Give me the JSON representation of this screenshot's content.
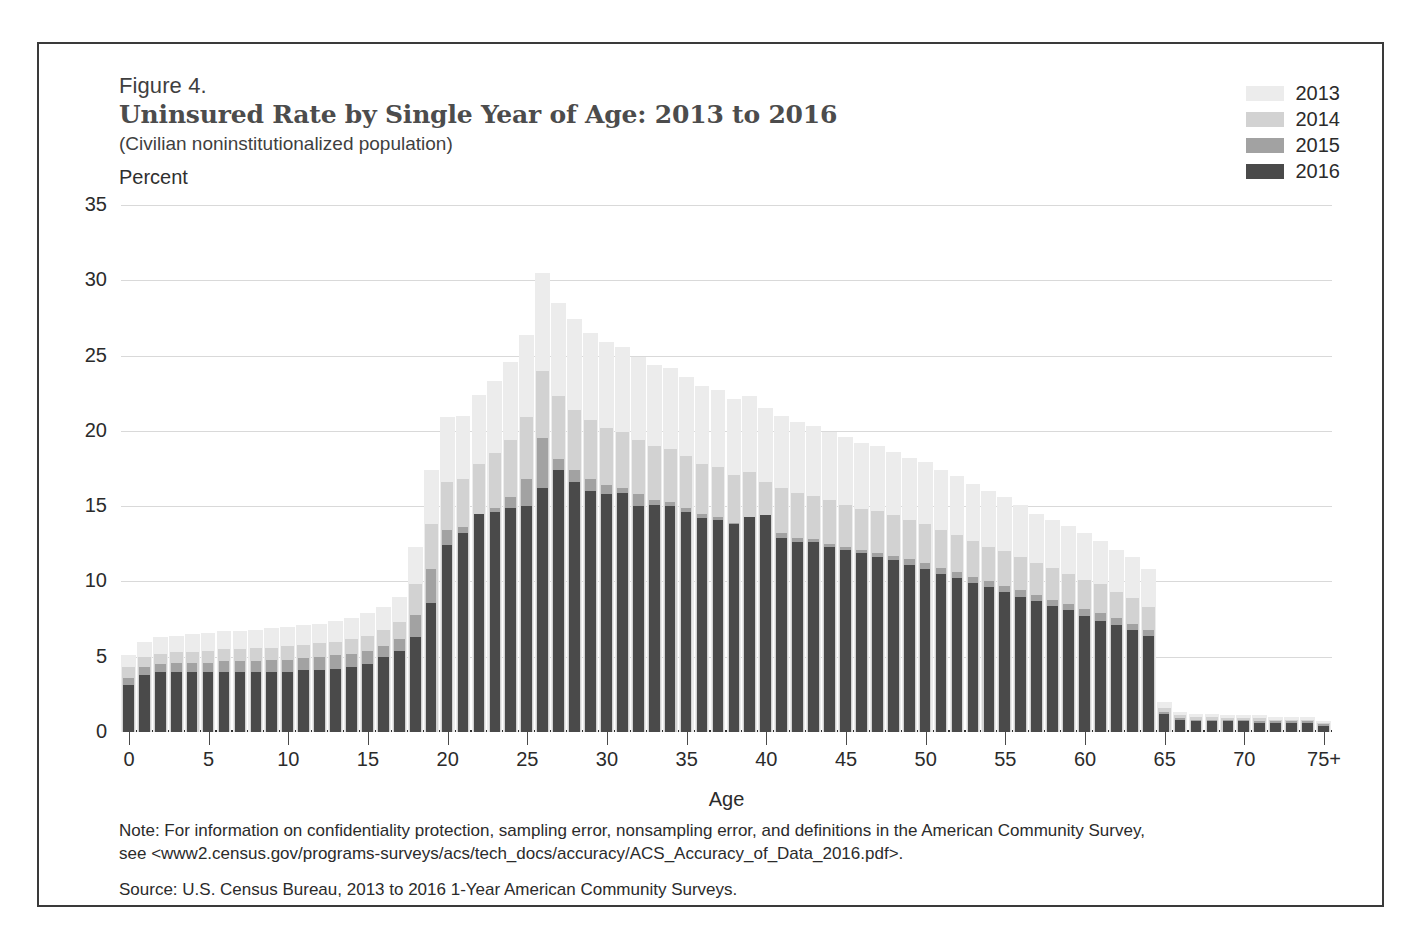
{
  "figure": {
    "number": "Figure 4.",
    "title": "Uninsured Rate by Single Year of Age: 2013 to 2016",
    "subtitle": "(Civilian noninstitutionalized population)",
    "unit_label": "Percent"
  },
  "notes": {
    "note_line_1": "Note: For information on confidentiality protection, sampling error, nonsampling error, and definitions in the American Community Survey,",
    "note_line_2": "see <www2.census.gov/programs-surveys/acs/tech_docs/accuracy/ACS_Accuracy_of_Data_2016.pdf>.",
    "source": "Source: U.S. Census Bureau, 2013 to 2016 1-Year American Community Surveys."
  },
  "colors": {
    "y2013": "#ececec",
    "y2014": "#d2d2d2",
    "y2015": "#a2a2a2",
    "y2016": "#4a4a4a",
    "gridline": "#d9d9d9",
    "axis": "#2f2f2f",
    "title": "#4c4c4c",
    "border": "#3a3a3a"
  },
  "chart_data": {
    "type": "bar",
    "title": "Uninsured Rate by Single Year of Age: 2013 to 2016",
    "subtitle": "(Civilian noninstitutionalized population)",
    "xlabel": "Age",
    "ylabel": "Percent",
    "ylim": [
      0,
      35
    ],
    "ytick_labels": [
      "0",
      "5",
      "10",
      "15",
      "20",
      "25",
      "30",
      "35"
    ],
    "yticks": [
      0,
      5,
      10,
      15,
      20,
      25,
      30,
      35
    ],
    "xtick_labels": [
      "0",
      "5",
      "10",
      "15",
      "20",
      "25",
      "30",
      "35",
      "40",
      "45",
      "50",
      "55",
      "60",
      "65",
      "70",
      "75+"
    ],
    "xticks": [
      0,
      5,
      10,
      15,
      20,
      25,
      30,
      35,
      40,
      45,
      50,
      55,
      60,
      65,
      70,
      75
    ],
    "grid": true,
    "legend_position": "top-right",
    "overlap_style": "front-to-back overlapping bars, darkest (2016) in front",
    "categories": [
      0,
      1,
      2,
      3,
      4,
      5,
      6,
      7,
      8,
      9,
      10,
      11,
      12,
      13,
      14,
      15,
      16,
      17,
      18,
      19,
      20,
      21,
      22,
      23,
      24,
      25,
      26,
      27,
      28,
      29,
      30,
      31,
      32,
      33,
      34,
      35,
      36,
      37,
      38,
      39,
      40,
      41,
      42,
      43,
      44,
      45,
      46,
      47,
      48,
      49,
      50,
      51,
      52,
      53,
      54,
      55,
      56,
      57,
      58,
      59,
      60,
      61,
      62,
      63,
      64,
      65,
      66,
      67,
      68,
      69,
      70,
      71,
      72,
      73,
      74,
      75
    ],
    "series": [
      {
        "name": "2013",
        "color": "#ececec",
        "values": [
          5.1,
          6.0,
          6.3,
          6.4,
          6.5,
          6.6,
          6.7,
          6.7,
          6.8,
          6.9,
          7.0,
          7.1,
          7.2,
          7.4,
          7.6,
          7.9,
          8.3,
          9.0,
          12.3,
          17.4,
          20.9,
          21.0,
          22.4,
          23.3,
          24.6,
          26.4,
          30.5,
          28.5,
          27.4,
          26.5,
          25.9,
          25.6,
          24.9,
          24.4,
          24.2,
          23.6,
          23.0,
          22.7,
          22.1,
          22.3,
          21.5,
          21.0,
          20.6,
          20.3,
          19.9,
          19.6,
          19.2,
          19.0,
          18.6,
          18.2,
          17.9,
          17.4,
          17.0,
          16.5,
          16.0,
          15.6,
          15.1,
          14.5,
          14.1,
          13.7,
          13.2,
          12.7,
          12.1,
          11.6,
          10.8,
          2.0,
          1.3,
          1.2,
          1.2,
          1.1,
          1.1,
          1.1,
          1.0,
          1.0,
          1.0,
          0.7
        ]
      },
      {
        "name": "2014",
        "color": "#d2d2d2",
        "values": [
          4.3,
          5.0,
          5.2,
          5.3,
          5.3,
          5.4,
          5.5,
          5.5,
          5.6,
          5.6,
          5.7,
          5.8,
          5.9,
          6.0,
          6.2,
          6.4,
          6.8,
          7.3,
          9.8,
          13.8,
          16.6,
          16.8,
          17.8,
          18.5,
          19.4,
          20.9,
          24.0,
          22.3,
          21.4,
          20.7,
          20.2,
          19.9,
          19.4,
          19.0,
          18.8,
          18.3,
          17.8,
          17.6,
          17.1,
          17.3,
          16.6,
          16.2,
          15.9,
          15.7,
          15.4,
          15.1,
          14.8,
          14.7,
          14.4,
          14.1,
          13.8,
          13.4,
          13.1,
          12.7,
          12.3,
          12.0,
          11.6,
          11.2,
          10.9,
          10.5,
          10.1,
          9.8,
          9.3,
          8.9,
          8.3,
          1.6,
          1.1,
          1.0,
          1.0,
          0.9,
          0.9,
          0.9,
          0.8,
          0.8,
          0.8,
          0.6
        ]
      },
      {
        "name": "2015",
        "color": "#a2a2a2",
        "values": [
          3.6,
          4.3,
          4.5,
          4.6,
          4.6,
          4.6,
          4.7,
          4.7,
          4.7,
          4.8,
          4.8,
          4.9,
          5.0,
          5.1,
          5.2,
          5.4,
          5.7,
          6.2,
          7.8,
          10.8,
          13.4,
          13.6,
          14.2,
          14.9,
          15.6,
          16.8,
          19.5,
          18.1,
          17.4,
          16.8,
          16.4,
          16.2,
          15.8,
          15.4,
          15.3,
          14.9,
          14.5,
          14.3,
          13.9,
          14.1,
          13.5,
          13.2,
          12.9,
          12.8,
          12.5,
          12.3,
          12.1,
          11.9,
          11.7,
          11.5,
          11.2,
          10.9,
          10.6,
          10.3,
          10.0,
          9.7,
          9.4,
          9.1,
          8.8,
          8.5,
          8.2,
          7.9,
          7.6,
          7.2,
          6.8,
          1.3,
          0.9,
          0.8,
          0.8,
          0.8,
          0.8,
          0.7,
          0.7,
          0.7,
          0.7,
          0.5
        ]
      },
      {
        "name": "2016",
        "color": "#4a4a4a",
        "values": [
          3.1,
          3.8,
          4.0,
          4.0,
          4.0,
          4.0,
          4.0,
          4.0,
          4.0,
          4.0,
          4.0,
          4.1,
          4.1,
          4.2,
          4.3,
          4.5,
          5.0,
          5.4,
          6.3,
          8.6,
          12.4,
          13.2,
          14.5,
          14.6,
          14.9,
          15.0,
          16.2,
          17.4,
          16.6,
          16.0,
          15.8,
          15.9,
          15.0,
          15.1,
          15.0,
          14.6,
          14.2,
          14.1,
          13.8,
          14.3,
          14.4,
          12.9,
          12.6,
          12.6,
          12.3,
          12.1,
          11.9,
          11.6,
          11.4,
          11.1,
          10.8,
          10.5,
          10.2,
          9.9,
          9.6,
          9.3,
          9.0,
          8.7,
          8.4,
          8.1,
          7.7,
          7.4,
          7.1,
          6.8,
          6.4,
          1.2,
          0.8,
          0.7,
          0.7,
          0.7,
          0.7,
          0.6,
          0.6,
          0.6,
          0.6,
          0.4
        ]
      }
    ]
  }
}
